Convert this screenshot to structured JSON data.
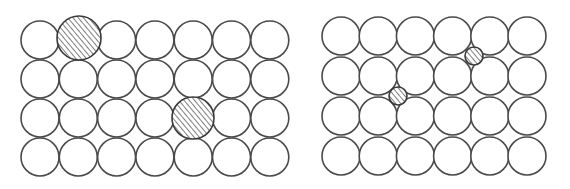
{
  "diagram": {
    "colors": {
      "stroke": "#4a4a4a",
      "hatch": "#3a3a3a",
      "background": "#ffffff"
    },
    "panels": [
      {
        "name": "substitutional-lattice",
        "cols": 7,
        "rows": 4,
        "origin": [
          40,
          40
        ],
        "spacing": [
          38.3,
          39
        ],
        "radius": 19,
        "solutes": [
          {
            "name": "large-substitutional-atom-1",
            "cx": 79,
            "cy": 38,
            "r": 22
          },
          {
            "name": "large-substitutional-atom-2",
            "cx": 193,
            "cy": 118,
            "r": 21
          }
        ]
      },
      {
        "name": "interstitial-lattice",
        "cols": 6,
        "rows": 4,
        "origin": [
          341,
          36
        ],
        "spacing": [
          37.2,
          40
        ],
        "radius": 19,
        "solutes": [
          {
            "name": "small-interstitial-atom-1",
            "cx": 474,
            "cy": 56,
            "r": 9
          },
          {
            "name": "small-interstitial-atom-2",
            "cx": 398,
            "cy": 96,
            "r": 9
          }
        ]
      }
    ]
  }
}
